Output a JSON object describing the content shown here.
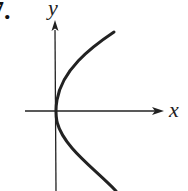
{
  "problem": {
    "number_label": "7."
  },
  "axes": {
    "x_label": "x",
    "y_label": "y"
  },
  "colors": {
    "ink": "#222222",
    "background": "#ffffff"
  },
  "curve": {
    "description": "Sideways parabola opening to the right (x = y^2 shape) with vertex at the origin",
    "equation_shape": "x = a*y^2",
    "vertex": "origin"
  }
}
